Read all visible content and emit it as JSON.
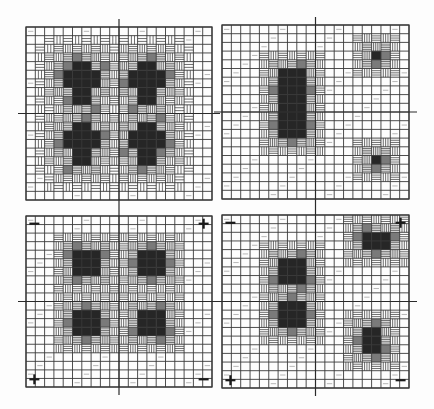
{
  "figure": {
    "title": "",
    "grid_cells": 20,
    "colors": {
      "background": "#fdfdfd",
      "grid": "#3a3a3a",
      "axis": "#2a2a2a",
      "dark": "#262626",
      "mid": "#7a7a7a",
      "hatch": "#4a4a4a"
    },
    "panels": [
      {
        "id": "top-left",
        "x": 26,
        "y": 27,
        "w": 186,
        "h": 173,
        "corner_marks": [],
        "blobs": [
          {
            "cx": 5.5,
            "cy": 6.5,
            "core": [
              [
                5,
                4,
                2,
                5
              ],
              [
                4,
                5,
                4,
                2
              ]
            ],
            "halo": 3,
            "shape": "cross"
          },
          {
            "cx": 12.5,
            "cy": 6.5,
            "core": [
              [
                12,
                4,
                2,
                5
              ],
              [
                11,
                5,
                4,
                2
              ]
            ],
            "halo": 3,
            "shape": "cross"
          },
          {
            "cx": 5.5,
            "cy": 12.5,
            "core": [
              [
                5,
                11,
                2,
                5
              ],
              [
                4,
                12,
                4,
                2
              ]
            ],
            "halo": 3,
            "shape": "cross"
          },
          {
            "cx": 12.5,
            "cy": 12.5,
            "core": [
              [
                12,
                11,
                2,
                5
              ],
              [
                11,
                12,
                4,
                2
              ]
            ],
            "halo": 3,
            "shape": "cross"
          }
        ]
      },
      {
        "id": "top-right",
        "x": 222,
        "y": 25,
        "w": 187,
        "h": 174,
        "corner_marks": [],
        "blobs": [
          {
            "core": [
              [
                6,
                5,
                3,
                8
              ]
            ],
            "halo": 2
          },
          {
            "core": [
              [
                16,
                3,
                1,
                1
              ]
            ],
            "halo": 2
          },
          {
            "core": [
              [
                16,
                15,
                1,
                1
              ]
            ],
            "halo": 2
          }
        ]
      },
      {
        "id": "bottom-left",
        "x": 26,
        "y": 216,
        "w": 186,
        "h": 171,
        "corner_marks": [
          {
            "pos": "tl",
            "sign": "−"
          },
          {
            "pos": "tr",
            "sign": "+"
          },
          {
            "pos": "bl",
            "sign": "+"
          },
          {
            "pos": "br",
            "sign": "−"
          }
        ],
        "blobs": [
          {
            "core": [
              [
                5,
                4,
                3,
                3
              ]
            ],
            "halo": 2
          },
          {
            "core": [
              [
                12,
                4,
                3,
                3
              ]
            ],
            "halo": 2
          },
          {
            "core": [
              [
                5,
                11,
                3,
                3
              ]
            ],
            "halo": 2
          },
          {
            "core": [
              [
                12,
                11,
                3,
                3
              ]
            ],
            "halo": 2
          }
        ]
      },
      {
        "id": "bottom-right",
        "x": 222,
        "y": 215,
        "w": 187,
        "h": 173,
        "corner_marks": [
          {
            "pos": "tl",
            "sign": "−"
          },
          {
            "pos": "tr",
            "sign": "+"
          },
          {
            "pos": "bl",
            "sign": "+"
          },
          {
            "pos": "br",
            "sign": "−"
          }
        ],
        "blobs": [
          {
            "core": [
              [
                6,
                5,
                3,
                3
              ]
            ],
            "halo": 2
          },
          {
            "core": [
              [
                6,
                10,
                3,
                3
              ]
            ],
            "halo": 2
          },
          {
            "core": [
              [
                15,
                2,
                3,
                2
              ]
            ],
            "halo": 2
          },
          {
            "core": [
              [
                15,
                13,
                2,
                3
              ]
            ],
            "halo": 2
          }
        ]
      }
    ]
  }
}
